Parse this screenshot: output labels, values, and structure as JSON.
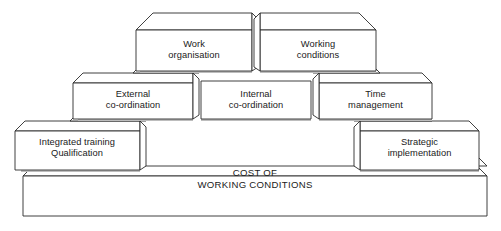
{
  "diagram": {
    "type": "stepped-pyramid",
    "title_block": {
      "line1": "COST OF",
      "line2": "WORKING CONDITIONS",
      "full": "COST OF\nWORKING CONDITIONS"
    },
    "tiers": [
      {
        "level": 1,
        "name": "top-tier",
        "blocks": [
          {
            "id": "work-organisation",
            "line1": "Work",
            "line2": "organisation",
            "full": "Work\norganisation"
          },
          {
            "id": "working-conditions",
            "line1": "Working",
            "line2": "conditions",
            "full": "Working\nconditions"
          }
        ]
      },
      {
        "level": 2,
        "name": "middle-tier",
        "blocks": [
          {
            "id": "external-co-ordination",
            "line1": "External",
            "line2": "co-ordination",
            "full": "External\nco-ordination"
          },
          {
            "id": "internal-co-ordination",
            "line1": "Internal",
            "line2": "co-ordination",
            "full": "Internal\nco-ordination"
          },
          {
            "id": "time-management",
            "line1": "Time",
            "line2": "management",
            "full": "Time\nmanagement"
          }
        ]
      },
      {
        "level": 3,
        "name": "bottom-tier",
        "blocks": [
          {
            "id": "integrated-training-qualification",
            "line1": "Integrated training",
            "line2": "Qualification",
            "full": "Integrated training\nQualification"
          },
          {
            "id": "strategic-implementation",
            "line1": "Strategic",
            "line2": "implementation",
            "full": "Strategic\nimplementation"
          }
        ]
      }
    ],
    "colors": {
      "stroke": "#2b2b2b",
      "fill": "#ffffff",
      "shadow": "#bdbdbd",
      "text": "#1a1a1a",
      "background": "#ffffff"
    }
  }
}
